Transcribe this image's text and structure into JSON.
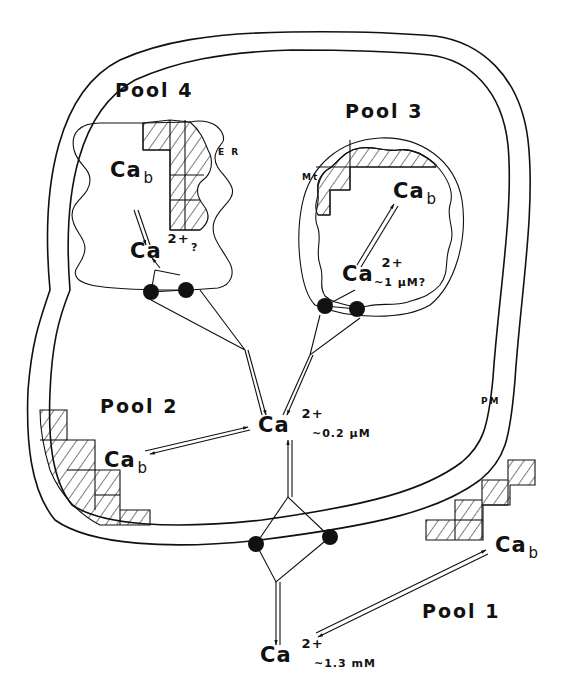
{
  "diagram": {
    "type": "cell-calcium-pools-schematic",
    "pools": [
      {
        "id": "pool1",
        "label": "Pool 1",
        "region": "extracellular"
      },
      {
        "id": "pool2",
        "label": "Pool 2",
        "region": "cytosol"
      },
      {
        "id": "pool3",
        "label": "Pool 3",
        "region": "mitochondrion"
      },
      {
        "id": "pool4",
        "label": "Pool 4",
        "region": "endoplasmic reticulum"
      }
    ],
    "species": {
      "bound": {
        "symbol": "Ca",
        "subscript": "b"
      },
      "free": {
        "symbol": "Ca",
        "superscript": "2+"
      }
    },
    "concentrations": {
      "pool1": "~1.3 mM",
      "pool2": "~0.2 μM",
      "pool3": "~1 μM?",
      "pool4": "?"
    },
    "organelle_labels": {
      "er": "ER",
      "mito": "Mt",
      "membrane": "PM"
    },
    "labels": {
      "pool1": "Pool 1",
      "pool2": "Pool 2",
      "pool3": "Pool 3",
      "pool4": "Pool 4",
      "ca": "Ca",
      "b": "b",
      "two_plus": "2+",
      "conc_pool1": "~1.3 mM",
      "conc_pool2": "~0.2 μM",
      "conc_pool3": "~1 μM?",
      "conc_pool4": "?",
      "er": "E R",
      "mt": "Mt",
      "pm": "PM"
    },
    "connections": [
      {
        "from": "pool1.free",
        "to": "pool1.bound",
        "type": "reversible"
      },
      {
        "from": "pool1.free",
        "to": "pool2.free",
        "type": "membrane-transport",
        "via": "plasma membrane pumps/channels"
      },
      {
        "from": "pool2.free",
        "to": "pool2.bound",
        "type": "reversible"
      },
      {
        "from": "pool2.free",
        "to": "pool3.free",
        "type": "membrane-transport",
        "via": "mitochondrial membrane"
      },
      {
        "from": "pool2.free",
        "to": "pool4.free",
        "type": "membrane-transport",
        "via": "ER membrane"
      },
      {
        "from": "pool3.free",
        "to": "pool3.bound",
        "type": "reversible"
      },
      {
        "from": "pool4.free",
        "to": "pool4.bound",
        "type": "reversible"
      }
    ]
  }
}
